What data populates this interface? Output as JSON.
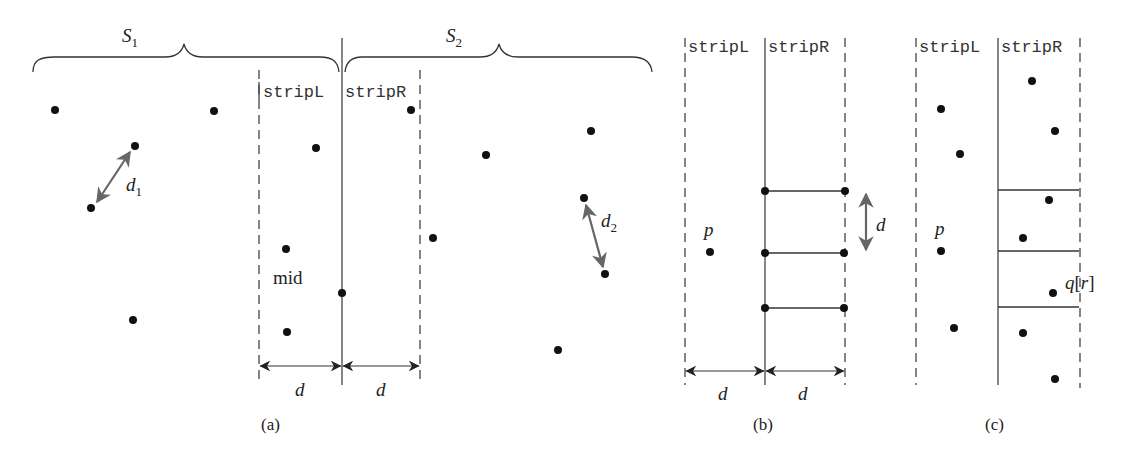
{
  "figure": {
    "panels": [
      {
        "id": "a",
        "caption": "(a)",
        "set_labels": [
          "S",
          "S"
        ],
        "set_subscripts": [
          "1",
          "2"
        ],
        "strip_left_label": "stripL",
        "strip_right_label": "stripR",
        "mid_label": "mid",
        "distance_labels": [
          "d",
          "d"
        ],
        "d1_label": "d",
        "d1_sub": "1",
        "d2_label": "d",
        "d2_sub": "2"
      },
      {
        "id": "b",
        "caption": "(b)",
        "strip_left_label": "stripL",
        "strip_right_label": "stripR",
        "point_label": "p",
        "vertical_d_label": "d",
        "distance_labels": [
          "d",
          "d"
        ]
      },
      {
        "id": "c",
        "caption": "(c)",
        "strip_left_label": "stripL",
        "strip_right_label": "stripR",
        "point_label": "p",
        "q_label": "q",
        "q_index": "r"
      }
    ],
    "colors": {
      "line": "#333333",
      "point": "#111111",
      "arrow_gray": "#666666"
    }
  }
}
